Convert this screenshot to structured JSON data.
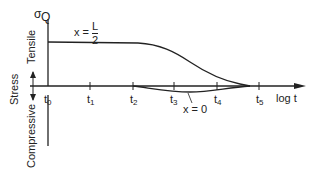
{
  "diagram": {
    "y_axis_symbol": "σ",
    "y_axis_marker": "Q",
    "y_axis_title": "Stress",
    "upper_region_label": "Tensile",
    "lower_region_label": "Compressive",
    "x_axis_label": "log t",
    "ticks": [
      "t",
      "t",
      "t",
      "t",
      "t",
      "t"
    ],
    "tick_subscripts": [
      "0",
      "1",
      "2",
      "3",
      "4",
      "5"
    ],
    "curves": [
      {
        "label_prefix": "x = ",
        "label_num": "L",
        "label_den": "2",
        "description": "tensile curve at mid-length, flat then decays to zero near t5"
      },
      {
        "label": "x = 0",
        "description": "small compressive dip between t2 and t5"
      }
    ],
    "colors": {
      "line": "#222222",
      "background": "#ffffff"
    }
  }
}
